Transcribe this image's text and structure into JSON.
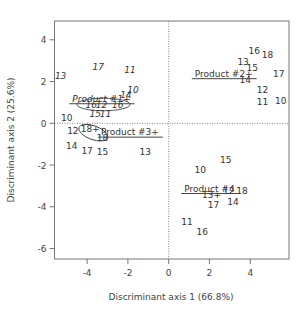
{
  "chart_data": {
    "type": "scatter",
    "title": "",
    "xlabel": "Discriminant axis 1 (66.8%)",
    "ylabel": "Discriminant axis 2 (25.6%)",
    "xlim": [
      -5.6,
      5.9
    ],
    "ylim": [
      -6.5,
      4.9
    ],
    "xticks": [
      -4,
      -2,
      0,
      2,
      4
    ],
    "yticks": [
      4,
      2,
      0,
      -2,
      -4,
      -6
    ],
    "grid": false,
    "reference_lines": {
      "x": 0,
      "y": 0,
      "style": "dotted"
    },
    "groups": [
      {
        "name": "Product #1",
        "centroid_label": "Product #1+",
        "centroid": [
          -3.3,
          1.2
        ],
        "font_style": "italic",
        "ellipse": {
          "center": [
            -3.2,
            0.9
          ],
          "rx": 1.3,
          "ry": 0.3,
          "angle": 0
        },
        "points": [
          {
            "label": "13",
            "x": -5.3,
            "y": 2.3
          },
          {
            "label": "17",
            "x": -3.45,
            "y": 2.7
          },
          {
            "label": "11",
            "x": -1.9,
            "y": 2.6
          },
          {
            "label": "14",
            "x": -2.1,
            "y": 1.4
          },
          {
            "label": "10",
            "x": -1.75,
            "y": 1.6
          },
          {
            "label": "16",
            "x": -3.8,
            "y": 0.9
          },
          {
            "label": "12",
            "x": -3.3,
            "y": 0.9
          },
          {
            "label": "16",
            "x": -2.5,
            "y": 0.9
          },
          {
            "label": "15",
            "x": -3.6,
            "y": 0.45
          },
          {
            "label": "11",
            "x": -3.1,
            "y": 0.45
          }
        ]
      },
      {
        "name": "Product #2",
        "centroid_label": "Product #2+",
        "centroid": [
          2.7,
          2.4
        ],
        "font_style": "normal",
        "points": [
          {
            "label": "16",
            "x": 4.2,
            "y": 3.5
          },
          {
            "label": "18",
            "x": 4.85,
            "y": 3.3
          },
          {
            "label": "13",
            "x": 3.65,
            "y": 2.95
          },
          {
            "label": "15",
            "x": 4.1,
            "y": 2.65
          },
          {
            "label": "14",
            "x": 3.75,
            "y": 2.1
          },
          {
            "label": "17",
            "x": 5.4,
            "y": 2.4
          },
          {
            "label": "12",
            "x": 4.6,
            "y": 1.6
          },
          {
            "label": "11",
            "x": 4.6,
            "y": 1.05
          },
          {
            "label": "10",
            "x": 5.5,
            "y": 1.1
          }
        ]
      },
      {
        "name": "Product #3",
        "centroid_label": "Product #3+",
        "centroid": [
          -1.9,
          -0.4
        ],
        "font_style": "normal",
        "ellipse": {
          "center": [
            -3.7,
            -0.45
          ],
          "rx": 0.75,
          "ry": 0.33,
          "angle": 20
        },
        "points": [
          {
            "label": "10",
            "x": -5.0,
            "y": 0.3
          },
          {
            "label": "12",
            "x": -4.7,
            "y": -0.35
          },
          {
            "label": "18+",
            "x": -3.85,
            "y": -0.25
          },
          {
            "label": "18",
            "x": -3.25,
            "y": -0.7
          },
          {
            "label": "14",
            "x": -4.75,
            "y": -1.05
          },
          {
            "label": "17",
            "x": -4.0,
            "y": -1.3
          },
          {
            "label": "15",
            "x": -3.25,
            "y": -1.35
          },
          {
            "label": "13",
            "x": -1.15,
            "y": -1.35
          }
        ]
      },
      {
        "name": "Product #4",
        "centroid_label": "Product #4",
        "centroid": [
          2.0,
          -3.1
        ],
        "font_style": "normal",
        "points": [
          {
            "label": "15",
            "x": 2.8,
            "y": -1.75
          },
          {
            "label": "10",
            "x": 1.55,
            "y": -2.2
          },
          {
            "label": "13+",
            "x": 2.1,
            "y": -3.4
          },
          {
            "label": "12",
            "x": 2.95,
            "y": -3.2
          },
          {
            "label": "18",
            "x": 3.6,
            "y": -3.2
          },
          {
            "label": "17",
            "x": 2.2,
            "y": -3.9
          },
          {
            "label": "14",
            "x": 3.15,
            "y": -3.75
          },
          {
            "label": "11",
            "x": 0.9,
            "y": -4.7
          },
          {
            "label": "16",
            "x": 1.65,
            "y": -5.2
          }
        ]
      }
    ]
  }
}
